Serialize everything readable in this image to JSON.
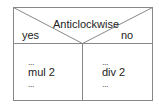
{
  "diagram": {
    "type": "nassi-shneiderman-decision",
    "condition": "Anticlockwise",
    "true_label": "yes",
    "false_label": "no",
    "true_branch": {
      "lines": [
        "...",
        "mul 2",
        "..."
      ]
    },
    "false_branch": {
      "lines": [
        "...",
        "div 2",
        "..."
      ]
    },
    "colors": {
      "border": "#888888",
      "text": "#222222",
      "background": "#ffffff"
    }
  }
}
